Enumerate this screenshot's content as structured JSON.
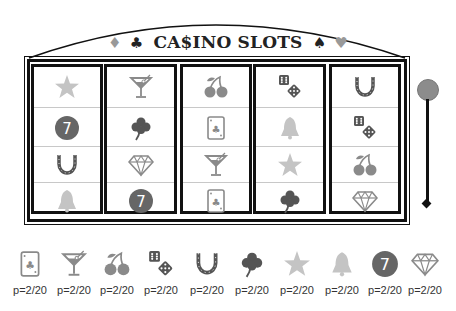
{
  "header": {
    "title": "CA$INO SLOTS",
    "left_suits": [
      "♦",
      "♣"
    ],
    "right_suits": [
      "♠",
      "♥"
    ]
  },
  "reels": [
    [
      "star",
      "seven",
      "horseshoe",
      "bell"
    ],
    [
      "martini",
      "clover",
      "diamond",
      "seven"
    ],
    [
      "cherries",
      "card",
      "martini",
      "card"
    ],
    [
      "dice",
      "bell",
      "star",
      "clover"
    ],
    [
      "horseshoe",
      "dice",
      "cherries",
      "diamond"
    ]
  ],
  "lever": {
    "label": "lever"
  },
  "legend": [
    {
      "symbol": "card",
      "prob": "p=2/20"
    },
    {
      "symbol": "martini",
      "prob": "p=2/20"
    },
    {
      "symbol": "cherries",
      "prob": "p=2/20"
    },
    {
      "symbol": "dice",
      "prob": "p=2/20"
    },
    {
      "symbol": "horseshoe",
      "prob": "p=2/20"
    },
    {
      "symbol": "clover",
      "prob": "p=2/20"
    },
    {
      "symbol": "star",
      "prob": "p=2/20"
    },
    {
      "symbol": "bell",
      "prob": "p=2/20"
    },
    {
      "symbol": "seven",
      "prob": "p=2/20"
    },
    {
      "symbol": "diamond",
      "prob": "p=2/20"
    }
  ],
  "colors": {
    "frame": "#111111",
    "icon_gray": "#8a8a8a",
    "icon_light": "#c4c4c4",
    "icon_dark": "#555555",
    "seven_bg": "#666666"
  }
}
